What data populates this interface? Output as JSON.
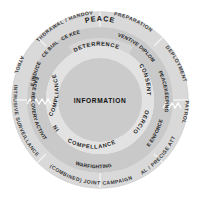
{
  "diagram": {
    "title": "PEACE",
    "center": {
      "label": "INFORMATION"
    },
    "rings": {
      "inner": {
        "name": "effects-ring",
        "segments": [
          {
            "label": "DETERRENCE"
          },
          {
            "label": "CONSENT"
          },
          {
            "label": "COERCION"
          },
          {
            "label": "COMPELLANCE"
          },
          {
            "label": "DENIAL"
          },
          {
            "label": "COMPLIANCE"
          }
        ]
      },
      "middle": {
        "name": "operations-ring",
        "segments": [
          {
            "label": "PREVENTIVE DIPLOMACY"
          },
          {
            "label": "PEACEKEEPING"
          },
          {
            "label": "PEACE ENFORCEMENT"
          },
          {
            "label": "WARFIGHTING"
          },
          {
            "label": "PEACE RECOVERY ACTIVITY"
          },
          {
            "label": "PEACE INDUCEMENT"
          },
          {
            "label": "PEACE BUILDING"
          },
          {
            "label": "PEACE KEEPING"
          }
        ]
      },
      "outer": {
        "name": "activities-ring",
        "segments": [
          {
            "label": "PREPARATION"
          },
          {
            "label": "DEPLOYMENT"
          },
          {
            "label": "PATROL"
          },
          {
            "label": "LOCAL / PRECISE ATTACK"
          },
          {
            "label": "(COMBINED) JOINT CAMPAIGN"
          },
          {
            "label": "INTRUSIVE SURVEILLANCE"
          },
          {
            "label": "PATROL"
          },
          {
            "label": "WITHDRAWAL / HANDOVER"
          }
        ]
      }
    },
    "colors": {
      "outer_ring": "#d9d9d9",
      "middle_ring": "#cfcfcf",
      "inner_ring": "#e3e3e3",
      "center_disc": "#cccccc",
      "peace_band": "#d2d2d2",
      "divider": "#f4f4f4",
      "background": "#ffffff"
    }
  }
}
